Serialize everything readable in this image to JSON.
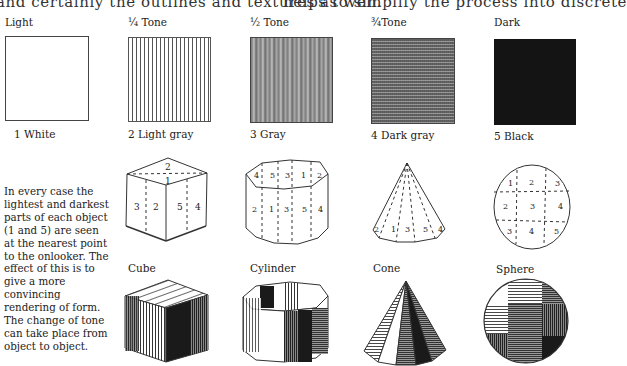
{
  "top_text": {
    "left": "and certainly the outlines and textures as well.",
    "right": "helps to simplify the process into discrete"
  },
  "tone_scale": {
    "headers": [
      "Light",
      "¼ Tone",
      "½ Tone",
      "¾Tone",
      "Dark"
    ],
    "swatches": [
      {
        "caption": "1   White",
        "fill": "#ffffff"
      },
      {
        "caption": "2 Light gray",
        "fill": "#e6e6e6"
      },
      {
        "caption": "3 Gray",
        "fill": "#8f8f8f"
      },
      {
        "caption": "4 Dark gray",
        "fill": "#5a5a5a"
      },
      {
        "caption": "5 Black",
        "fill": "#141414"
      }
    ]
  },
  "explanation": "In every case the lightest and darkest parts of each object (1 and 5) are seen at the nearest point to the onlooker. The effect of this is to give a more convincing rendering of form. The change of tone can take place from object to object.",
  "diagrams": {
    "cube": {
      "numbers": [
        "2",
        "1",
        "3",
        "2",
        "5",
        "4"
      ]
    },
    "cylinder": {
      "top_numbers": [
        "4",
        "5",
        "3",
        "1",
        "2"
      ],
      "side_numbers": [
        "2",
        "1",
        "3",
        "5",
        "4"
      ]
    },
    "cone": {
      "numbers": [
        "2",
        "1",
        "3",
        "5",
        "4"
      ]
    },
    "sphere": {
      "numbers": [
        "1",
        "2",
        "3",
        "2",
        "3",
        "4",
        "3",
        "4",
        "5"
      ]
    }
  },
  "shaded_objects": {
    "labels": [
      "Cube",
      "Cylinder",
      "Cone",
      "Sphere"
    ]
  }
}
